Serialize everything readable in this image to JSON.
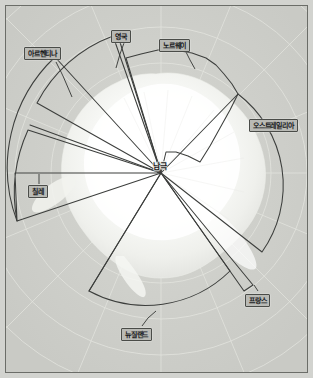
{
  "figure": {
    "type": "polar-sector-map",
    "projection": "south-polar-azimuthal",
    "background_color": "#cfd0cb",
    "frame_color": "#6b6d68",
    "sector_line_color": "#3c3e3c",
    "landmass_color": "#f7f8f5",
    "graticule_color": "#e2e3de"
  },
  "center": {
    "label": "남극",
    "x": 155,
    "y": 167
  },
  "claims": [
    {
      "id": "argentina",
      "label": "아르헨티나",
      "start_angle": 190,
      "end_angle": 236,
      "callout": {
        "x": 18,
        "y": 41
      },
      "leader": {
        "from_x": 52,
        "to_x": 62,
        "to_y": 88
      }
    },
    {
      "id": "uk",
      "label": "영국",
      "start_angle": 190,
      "end_angle": 260,
      "callout": {
        "x": 105,
        "y": 24
      },
      "leader": {
        "from_x": 122,
        "to_x": 112,
        "to_y": 60
      }
    },
    {
      "id": "chile",
      "label": "칠레",
      "start_angle": 180,
      "end_angle": 218,
      "callout": {
        "x": 22,
        "y": 179
      },
      "leader": {
        "from_x": 33,
        "to_x": 33,
        "to_y": 168
      }
    },
    {
      "id": "norway",
      "label": "노르웨이",
      "start_angle": 280,
      "end_angle": 335,
      "callout": {
        "x": 158,
        "y": 33
      },
      "leader": {
        "from_x": 180,
        "to_x": 188,
        "to_y": 62
      }
    },
    {
      "id": "australia",
      "label": "오스트레일리아",
      "start_angle": 337,
      "end_angle": 73,
      "callout": {
        "x": 248,
        "y": 113
      },
      "leader": null
    },
    {
      "id": "france",
      "label": "프랑스",
      "start_angle": 60,
      "end_angle": 66,
      "callout": {
        "x": 243,
        "y": 288
      },
      "leader": {
        "from_x": 252,
        "to_x": 243,
        "to_y": 277
      }
    },
    {
      "id": "newzealand",
      "label": "뉴질랜드",
      "start_angle": 75,
      "end_angle": 128,
      "callout": {
        "x": 120,
        "y": 322
      },
      "leader": {
        "from_x": 138,
        "to_x": 146,
        "to_y": 307
      }
    }
  ],
  "unclaimed_sector": {
    "start_angle": 128,
    "end_angle": 180,
    "label": ""
  }
}
